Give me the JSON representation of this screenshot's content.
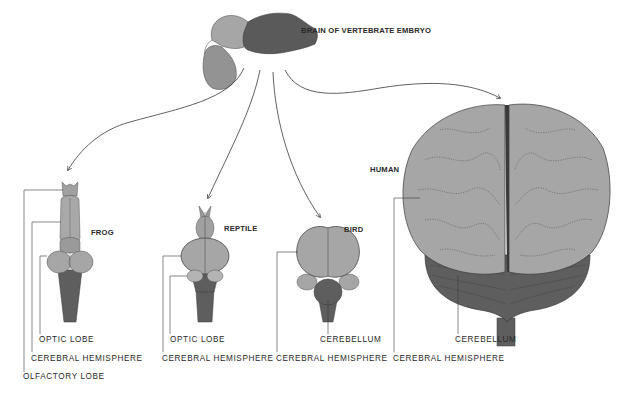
{
  "diagram": {
    "title": "BRAIN OF VERTEBRATE EMBRYO",
    "colors": {
      "background": "#ffffff",
      "light_gray": "#a6a6a6",
      "mid_gray": "#8e8e8e",
      "dark_gray": "#5e5e5e",
      "outline": "#3a3a3a",
      "text": "#2a2a2a"
    },
    "specimens": [
      {
        "name": "FROG",
        "labels": [
          "OPTIC LOBE",
          "CEREBRAL HEMISPHERE",
          "OLFACTORY LOBE"
        ]
      },
      {
        "name": "REPTILE",
        "labels": [
          "OPTIC LOBE",
          "CEREBRAL HEMISPHERE"
        ]
      },
      {
        "name": "BIRD",
        "labels": [
          "CEREBELLUM",
          "CEREBRAL HEMISPHERE"
        ]
      },
      {
        "name": "HUMAN",
        "labels": [
          "CEREBELLUM",
          "CEREBRAL HEMISPHERE"
        ]
      }
    ]
  }
}
